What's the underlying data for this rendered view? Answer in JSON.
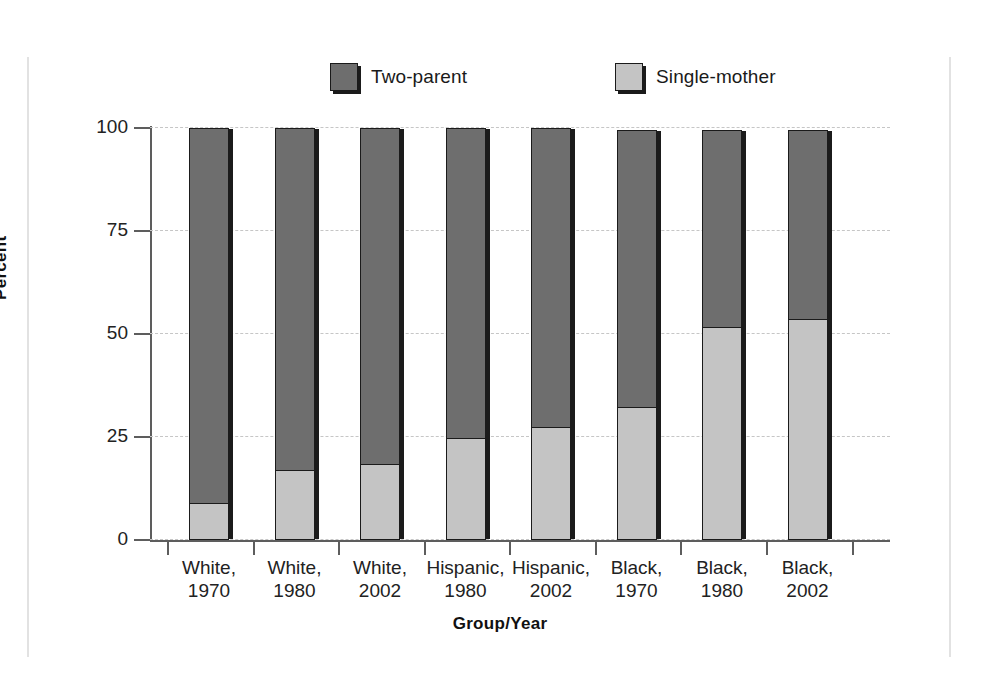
{
  "chart_data": {
    "type": "bar",
    "subtype": "stacked-100-percent",
    "title": "",
    "xlabel": "Group/Year",
    "ylabel": "Percent",
    "ylim": [
      0,
      100
    ],
    "yticks": [
      0,
      25,
      50,
      75,
      100
    ],
    "grid": "horizontal-dashed",
    "legend_position": "top-center",
    "categories": [
      "White, 1970",
      "White, 1980",
      "White, 2002",
      "Hispanic, 1980",
      "Hispanic, 2002",
      "Black, 1970",
      "Black, 1980",
      "Black, 2002"
    ],
    "category_lines": [
      [
        "White,",
        "1970"
      ],
      [
        "White,",
        "1980"
      ],
      [
        "White,",
        "2002"
      ],
      [
        "Hispanic,",
        "1980"
      ],
      [
        "Hispanic,",
        "2002"
      ],
      [
        "Black,",
        "1970"
      ],
      [
        "Black,",
        "1980"
      ],
      [
        "Black,",
        "2002"
      ]
    ],
    "series": [
      {
        "name": "Two-parent",
        "color": "#6e6e6e",
        "values": [
          91.5,
          83.5,
          82,
          75.5,
          73,
          68,
          48,
          46
        ]
      },
      {
        "name": "Single-mother",
        "color": "#c4c4c4",
        "values": [
          8.5,
          16.5,
          18,
          24.5,
          27,
          32,
          51.5,
          53.5
        ]
      }
    ],
    "bar_totals": [
      100,
      100,
      100,
      100,
      100,
      99.5,
      99.5,
      99.5
    ]
  },
  "legend": {
    "entries": [
      {
        "label": "Two-parent",
        "color": "#6e6e6e"
      },
      {
        "label": "Single-mother",
        "color": "#c4c4c4"
      }
    ]
  },
  "axes": {
    "y": {
      "title": "Percent",
      "tick_labels": [
        "100",
        "75",
        "50",
        "25",
        "0"
      ]
    },
    "x": {
      "title": "Group/Year"
    }
  },
  "colors": {
    "two_parent": "#6e6e6e",
    "single_mother": "#c4c4c4",
    "outline": "#1b1b1b",
    "axis": "#5d5d5d",
    "gridline": "#c6c6c6",
    "frame_rule": "#e2e2e2",
    "background": "#ffffff"
  }
}
